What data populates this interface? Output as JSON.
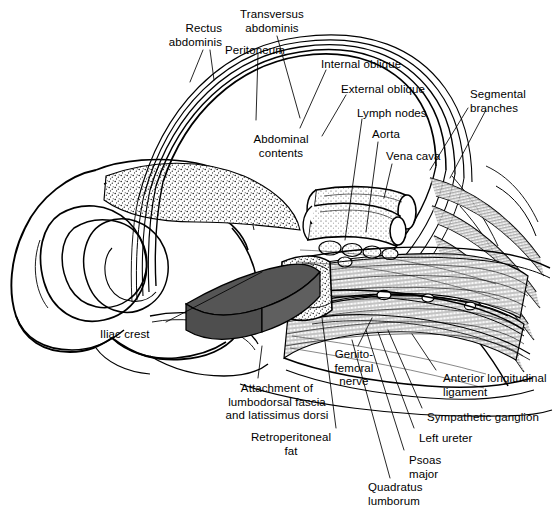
{
  "figure": {
    "colors": {
      "ink": "#000000",
      "paper": "#ffffff",
      "fat_shade": "#555555",
      "stipple": "#1a1a1a"
    }
  },
  "labels": [
    {
      "id": "rectus-abdominis",
      "text": "Rectus\nabdominis",
      "x": 222,
      "y": 22,
      "align": "r"
    },
    {
      "id": "transversus-abdominis",
      "text": "Transversus\nabdominis",
      "x": 272,
      "y": 8,
      "align": "c"
    },
    {
      "id": "peritoneum",
      "text": "Peritoneum",
      "x": 225,
      "y": 44,
      "align": "l"
    },
    {
      "id": "internal-oblique",
      "text": "Internal oblique",
      "x": 321,
      "y": 58,
      "align": "l"
    },
    {
      "id": "external-oblique",
      "text": "External oblique",
      "x": 341,
      "y": 83,
      "align": "l"
    },
    {
      "id": "lymph-nodes",
      "text": "Lymph nodes",
      "x": 357,
      "y": 107,
      "align": "l"
    },
    {
      "id": "segmental-branches",
      "text": "Segmental\nbranches",
      "x": 470,
      "y": 88,
      "align": "l"
    },
    {
      "id": "aorta",
      "text": "Aorta",
      "x": 372,
      "y": 128,
      "align": "l"
    },
    {
      "id": "vena-cava",
      "text": "Vena cava",
      "x": 386,
      "y": 150,
      "align": "l"
    },
    {
      "id": "abdominal-contents",
      "text": "Abdominal\ncontents",
      "x": 281,
      "y": 133,
      "align": "c"
    },
    {
      "id": "iliac-crest",
      "text": "Iliac crest",
      "x": 100,
      "y": 328,
      "align": "l"
    },
    {
      "id": "genitofemoral-nerve",
      "text": "Genito-\nfemoral\nnerve",
      "x": 354,
      "y": 348,
      "align": "c"
    },
    {
      "id": "attachment-lumbodorsal",
      "text": "Attachment of\nlumbodorsal fascia\nand latissimus dorsi",
      "x": 277,
      "y": 382,
      "align": "c"
    },
    {
      "id": "retroperitoneal-fat",
      "text": "Retroperitoneal\nfat",
      "x": 291,
      "y": 431,
      "align": "c"
    },
    {
      "id": "anterior-long-ligament",
      "text": "Anterior longitudinal\nligament",
      "x": 443,
      "y": 372,
      "align": "l"
    },
    {
      "id": "sympathetic-ganglion",
      "text": "Sympathetic ganglion",
      "x": 427,
      "y": 411,
      "align": "l"
    },
    {
      "id": "left-ureter",
      "text": "Left ureter",
      "x": 419,
      "y": 432,
      "align": "l"
    },
    {
      "id": "psoas-major",
      "text": "Psoas\nmajor",
      "x": 409,
      "y": 454,
      "align": "l"
    },
    {
      "id": "quadratus-lumborum",
      "text": "Quadratus\nlumborum",
      "x": 368,
      "y": 481,
      "align": "l"
    }
  ]
}
